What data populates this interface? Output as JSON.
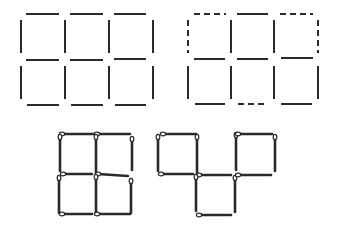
{
  "colors": {
    "stroke": "#2a2a2a",
    "background": "#ffffff",
    "head_fill": "#ffffff"
  },
  "figures": [
    {
      "name": "grid-3x2-solid",
      "segments": [
        {
          "x1": 26,
          "y1": 14,
          "x2": 59,
          "y2": 14,
          "style": "solid"
        },
        {
          "x1": 70,
          "y1": 14,
          "x2": 103,
          "y2": 14,
          "style": "solid"
        },
        {
          "x1": 114,
          "y1": 14,
          "x2": 146,
          "y2": 14,
          "style": "solid"
        },
        {
          "x1": 26,
          "y1": 60,
          "x2": 59,
          "y2": 60,
          "style": "solid"
        },
        {
          "x1": 70,
          "y1": 60,
          "x2": 103,
          "y2": 60,
          "style": "solid"
        },
        {
          "x1": 114,
          "y1": 59,
          "x2": 146,
          "y2": 59,
          "style": "solid"
        },
        {
          "x1": 27,
          "y1": 105,
          "x2": 59,
          "y2": 105,
          "style": "solid"
        },
        {
          "x1": 71,
          "y1": 105,
          "x2": 103,
          "y2": 105,
          "style": "solid"
        },
        {
          "x1": 115,
          "y1": 105,
          "x2": 146,
          "y2": 105,
          "style": "solid"
        },
        {
          "x1": 21,
          "y1": 20,
          "x2": 21,
          "y2": 53,
          "style": "solid"
        },
        {
          "x1": 65,
          "y1": 20,
          "x2": 65,
          "y2": 53,
          "style": "solid"
        },
        {
          "x1": 109,
          "y1": 20,
          "x2": 109,
          "y2": 53,
          "style": "solid"
        },
        {
          "x1": 153,
          "y1": 20,
          "x2": 153,
          "y2": 53,
          "style": "solid"
        },
        {
          "x1": 21,
          "y1": 66,
          "x2": 21,
          "y2": 99,
          "style": "solid"
        },
        {
          "x1": 65,
          "y1": 66,
          "x2": 65,
          "y2": 99,
          "style": "solid"
        },
        {
          "x1": 109,
          "y1": 66,
          "x2": 109,
          "y2": 99,
          "style": "solid"
        },
        {
          "x1": 153,
          "y1": 66,
          "x2": 153,
          "y2": 99,
          "style": "solid"
        }
      ]
    },
    {
      "name": "grid-3x2-with-dashed",
      "segments": [
        {
          "x1": 194,
          "y1": 14,
          "x2": 226,
          "y2": 14,
          "style": "dashed"
        },
        {
          "x1": 237,
          "y1": 14,
          "x2": 268,
          "y2": 14,
          "style": "solid"
        },
        {
          "x1": 280,
          "y1": 14,
          "x2": 313,
          "y2": 14,
          "style": "dashed"
        },
        {
          "x1": 194,
          "y1": 59,
          "x2": 225,
          "y2": 59,
          "style": "solid"
        },
        {
          "x1": 237,
          "y1": 59,
          "x2": 268,
          "y2": 59,
          "style": "solid"
        },
        {
          "x1": 281,
          "y1": 58,
          "x2": 313,
          "y2": 58,
          "style": "solid"
        },
        {
          "x1": 195,
          "y1": 104,
          "x2": 225,
          "y2": 104,
          "style": "solid"
        },
        {
          "x1": 238,
          "y1": 104,
          "x2": 268,
          "y2": 104,
          "style": "dashed"
        },
        {
          "x1": 281,
          "y1": 104,
          "x2": 312,
          "y2": 104,
          "style": "solid"
        },
        {
          "x1": 188,
          "y1": 20,
          "x2": 188,
          "y2": 53,
          "style": "dashed"
        },
        {
          "x1": 231,
          "y1": 20,
          "x2": 231,
          "y2": 53,
          "style": "solid"
        },
        {
          "x1": 274,
          "y1": 20,
          "x2": 274,
          "y2": 53,
          "style": "solid"
        },
        {
          "x1": 318,
          "y1": 20,
          "x2": 318,
          "y2": 53,
          "style": "dashed"
        },
        {
          "x1": 188,
          "y1": 66,
          "x2": 188,
          "y2": 99,
          "style": "solid"
        },
        {
          "x1": 231,
          "y1": 66,
          "x2": 231,
          "y2": 99,
          "style": "solid"
        },
        {
          "x1": 274,
          "y1": 66,
          "x2": 274,
          "y2": 99,
          "style": "solid"
        },
        {
          "x1": 318,
          "y1": 66,
          "x2": 318,
          "y2": 99,
          "style": "solid"
        }
      ]
    },
    {
      "name": "matchstick-figure-left",
      "matches": [
        {
          "x1": 62,
          "y1": 134,
          "x2": 94,
          "y2": 134
        },
        {
          "x1": 97,
          "y1": 134,
          "x2": 130,
          "y2": 134
        },
        {
          "x1": 60,
          "y1": 137,
          "x2": 60,
          "y2": 171
        },
        {
          "x1": 96,
          "y1": 137,
          "x2": 96,
          "y2": 173
        },
        {
          "x1": 132,
          "y1": 139,
          "x2": 132,
          "y2": 170
        },
        {
          "x1": 63,
          "y1": 174,
          "x2": 92,
          "y2": 174
        },
        {
          "x1": 98,
          "y1": 174,
          "x2": 128,
          "y2": 176
        },
        {
          "x1": 59,
          "y1": 178,
          "x2": 59,
          "y2": 213
        },
        {
          "x1": 96,
          "y1": 177,
          "x2": 96,
          "y2": 212
        },
        {
          "x1": 131,
          "y1": 181,
          "x2": 131,
          "y2": 213
        },
        {
          "x1": 62,
          "y1": 214,
          "x2": 92,
          "y2": 214
        },
        {
          "x1": 97,
          "y1": 214,
          "x2": 130,
          "y2": 214
        }
      ]
    },
    {
      "name": "matchstick-figure-right",
      "matches": [
        {
          "x1": 163,
          "y1": 134,
          "x2": 196,
          "y2": 134
        },
        {
          "x1": 158,
          "y1": 137,
          "x2": 158,
          "y2": 171
        },
        {
          "x1": 197,
          "y1": 137,
          "x2": 197,
          "y2": 173
        },
        {
          "x1": 161,
          "y1": 174,
          "x2": 193,
          "y2": 174
        },
        {
          "x1": 199,
          "y1": 175,
          "x2": 231,
          "y2": 175
        },
        {
          "x1": 196,
          "y1": 177,
          "x2": 196,
          "y2": 211
        },
        {
          "x1": 199,
          "y1": 215,
          "x2": 231,
          "y2": 215
        },
        {
          "x1": 235,
          "y1": 178,
          "x2": 235,
          "y2": 212
        },
        {
          "x1": 236,
          "y1": 135,
          "x2": 236,
          "y2": 170
        },
        {
          "x1": 238,
          "y1": 134,
          "x2": 272,
          "y2": 134
        },
        {
          "x1": 275,
          "y1": 137,
          "x2": 275,
          "y2": 171
        },
        {
          "x1": 238,
          "y1": 175,
          "x2": 271,
          "y2": 175
        }
      ]
    }
  ]
}
